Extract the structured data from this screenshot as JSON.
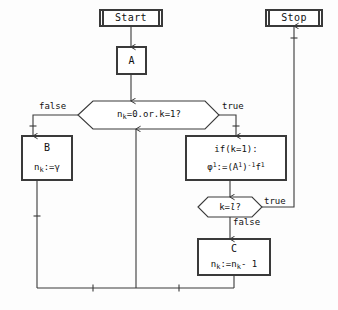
{
  "diagram": {
    "stroke_color": "#3a3a3a",
    "fill_color": "#ffffff",
    "text_color": "#111111",
    "background_color": "#fdfdfd"
  },
  "nodes": {
    "start": {
      "label": "Start",
      "shape": "terminal"
    },
    "stop": {
      "label": "Stop",
      "shape": "terminal"
    },
    "a": {
      "label": "A",
      "shape": "process"
    },
    "decision1": {
      "label": "n_k=0.or.k=1?",
      "shape": "decision"
    },
    "b": {
      "line1": "B",
      "line2": "n_k:=γ",
      "shape": "process"
    },
    "ifbox": {
      "line1": "if(k=1):",
      "line2": "φ¹:=(A¹)⁻¹f¹",
      "shape": "process"
    },
    "decision2": {
      "label": "k=l?",
      "shape": "decision"
    },
    "c": {
      "line1": "C",
      "line2": "n_k:=n_k- 1",
      "shape": "process"
    }
  },
  "edge_labels": {
    "d1_false": "false",
    "d1_true": "true",
    "d2_true": "true",
    "d2_false": "false"
  }
}
